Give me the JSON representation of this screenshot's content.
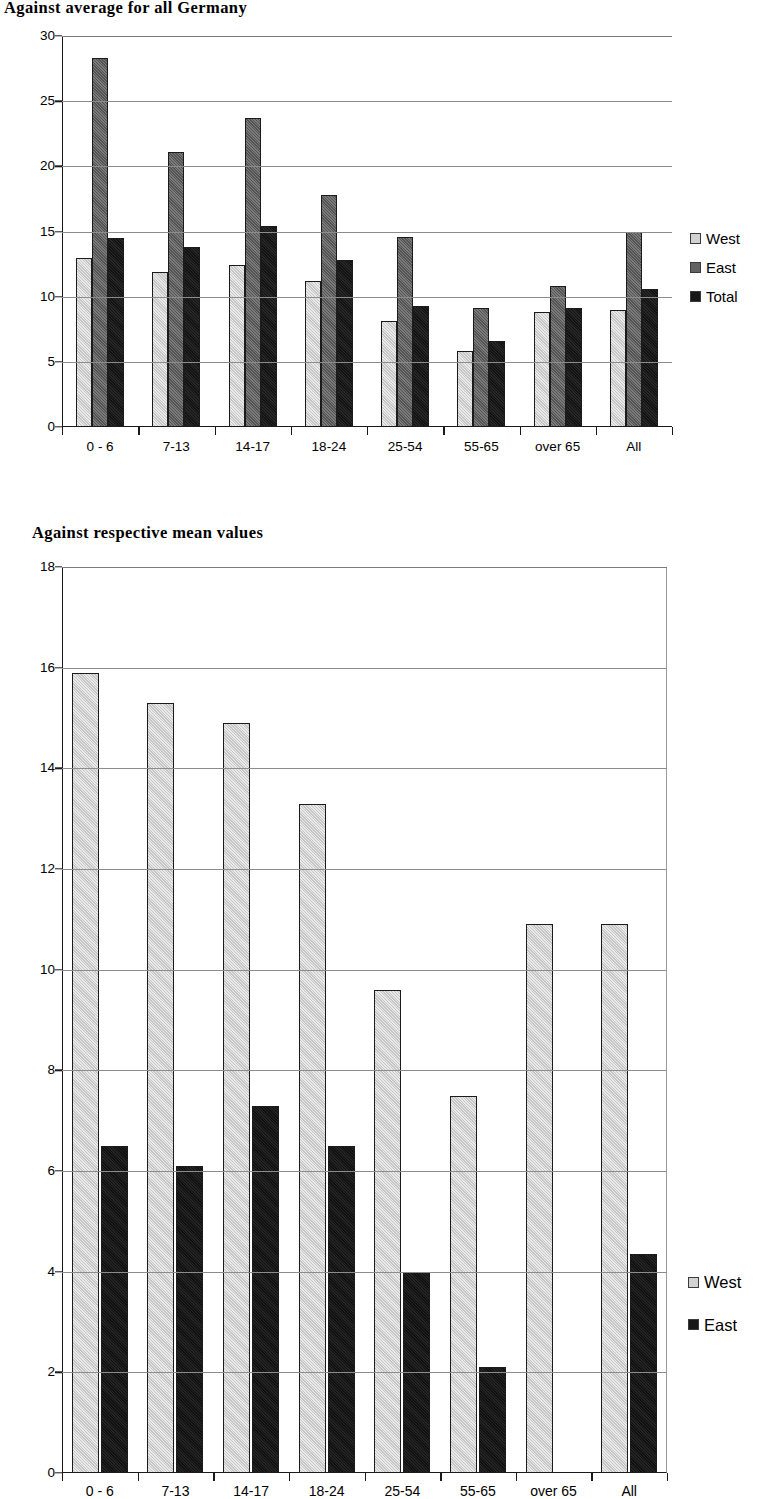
{
  "charts": [
    {
      "title": "Against average for all Germany",
      "legend_position": "right",
      "yticks": [
        0,
        5,
        10,
        15,
        20,
        25,
        30
      ]
    },
    {
      "title": "Against respective mean values",
      "legend_position": "right",
      "yticks": [
        0,
        2,
        4,
        6,
        8,
        10,
        12,
        14,
        16,
        18
      ]
    }
  ],
  "chart_data": [
    {
      "type": "bar",
      "title": "Against average for all Germany",
      "xlabel": "",
      "ylabel": "",
      "ylim": [
        0,
        30
      ],
      "yticks": [
        0,
        5,
        10,
        15,
        20,
        25,
        30
      ],
      "grid": true,
      "legend": "right",
      "categories": [
        "0 - 6",
        "7-13",
        "14-17",
        "18-24",
        "25-54",
        "55-65",
        "over 65",
        "All"
      ],
      "series": [
        {
          "name": "West",
          "values": [
            13.0,
            11.9,
            12.4,
            11.2,
            8.1,
            5.8,
            8.8,
            9.0
          ]
        },
        {
          "name": "East",
          "values": [
            28.3,
            21.1,
            23.7,
            17.8,
            14.6,
            9.1,
            10.8,
            15.0
          ]
        },
        {
          "name": "Total",
          "values": [
            14.5,
            13.8,
            15.4,
            12.8,
            9.25,
            6.6,
            9.1,
            10.6
          ]
        }
      ]
    },
    {
      "type": "bar",
      "title": "Against respective mean values",
      "xlabel": "",
      "ylabel": "",
      "ylim": [
        0,
        18
      ],
      "yticks": [
        0,
        2,
        4,
        6,
        8,
        10,
        12,
        14,
        16,
        18
      ],
      "grid": true,
      "legend": "right",
      "categories": [
        "0 - 6",
        "7-13",
        "14-17",
        "18-24",
        "25-54",
        "55-65",
        "over 65",
        "All"
      ],
      "series": [
        {
          "name": "West",
          "values": [
            15.9,
            15.3,
            14.9,
            13.3,
            9.6,
            7.5,
            10.9,
            10.9
          ]
        },
        {
          "name": "East",
          "values": [
            6.5,
            6.1,
            7.3,
            6.5,
            4.0,
            2.1,
            0,
            4.35
          ]
        }
      ]
    }
  ]
}
